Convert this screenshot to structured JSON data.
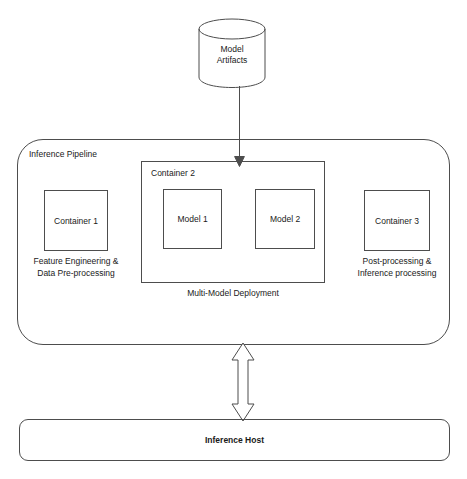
{
  "diagram": {
    "stroke_color": "#4d4d4d",
    "text_color": "#1a1a1a",
    "background_color": "#ffffff"
  },
  "artifacts_store": {
    "icon": "database-cylinder-icon",
    "label_line1": "Model",
    "label_line2": "Artifacts"
  },
  "pipeline": {
    "label": "Inference Pipeline",
    "container1": {
      "title": "Container 1",
      "caption_line1": "Feature Engineering &",
      "caption_line2": "Data Pre-processing"
    },
    "container2": {
      "title": "Container 2",
      "caption": "Multi-Model Deployment",
      "models": [
        {
          "label": "Model 1"
        },
        {
          "label": "Model 2"
        }
      ]
    },
    "container3": {
      "title": "Container 3",
      "caption_line1": "Post-processing &",
      "caption_line2": "Inference processing"
    }
  },
  "host": {
    "label": "Inference Host"
  },
  "connectors": {
    "artifacts_to_container2": {
      "name": "down-arrow-icon",
      "direction": "down"
    },
    "pipeline_to_host": {
      "name": "bidirectional-arrow-icon",
      "direction": "up-down"
    }
  }
}
